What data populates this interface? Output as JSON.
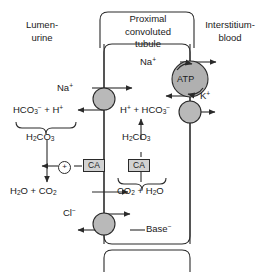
{
  "figure": {
    "type": "diagram"
  },
  "compartments": {
    "left_label_line1": "Lumen-",
    "left_label_line2": "urine",
    "center_label_line1": "Proximal",
    "center_label_line2": "convoluted",
    "center_label_line3": "tubule",
    "right_label_line1": "Interstitium-",
    "right_label_line2": "blood"
  },
  "species": {
    "na_lumen": "Na",
    "na_lumen_charge": "+",
    "na_cell": "Na",
    "na_cell_charge": "+",
    "k_blood": "K",
    "k_blood_charge": "+",
    "hco3_lumen": "HCO",
    "hco3_lumen_sub": "3",
    "hco3_lumen_charge": "−",
    "plus_sign_lumen": "+ H",
    "plus_sign_lumen_charge": "+",
    "h2co3_lumen": "H",
    "h2co3_lumen_sub1": "2",
    "h2co3_lumen_mid": "CO",
    "h2co3_lumen_sub2": "3",
    "h_cell": "H",
    "h_cell_charge": "+",
    "hco3_cell_pre": "+ HCO",
    "hco3_cell_sub": "3",
    "hco3_cell_charge": "−",
    "h2co3_cell": "H",
    "h2co3_cell_sub1": "2",
    "h2co3_cell_mid": "CO",
    "h2co3_cell_sub2": "3",
    "h2o_co2_lumen_a": "H",
    "h2o_co2_lumen_sub1": "2",
    "h2o_co2_lumen_b": "O + CO",
    "h2o_co2_lumen_sub2": "2",
    "co2_h2o_cell_a": "CO",
    "co2_h2o_cell_sub1": "2",
    "co2_h2o_cell_b": "+ H",
    "co2_h2o_cell_sub2": "2",
    "co2_h2o_cell_c": "O",
    "cl_lumen": "Cl",
    "cl_lumen_charge": "−",
    "base_cell": "Base",
    "base_cell_charge": "−"
  },
  "enzymes": {
    "ca_lumen": "CA",
    "ca_cell": "CA",
    "activation_symbol": "+"
  },
  "pump": {
    "label": "ATP"
  },
  "colors": {
    "transporter_fill": "#b9b9b9",
    "atp_fill": "#b0b0b0",
    "enzyme_box_fill": "#d2d2d2",
    "stroke": "#2a2a2a",
    "background": "#ffffff"
  },
  "geometry": {
    "apical_membrane_x": 104,
    "basolateral_membrane_x": 190
  }
}
